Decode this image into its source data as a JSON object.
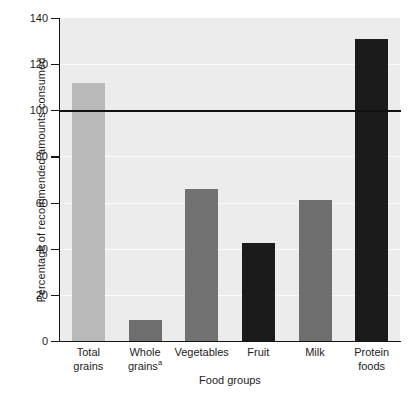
{
  "chart_data": {
    "type": "bar",
    "title": "",
    "subtitle": "",
    "xlabel": "Food groups",
    "ylabel": "Percentage of recommended amounts consumed",
    "categories": [
      "Total grains",
      "Whole grainsᵃ",
      "Vegetables",
      "Fruit",
      "Milk",
      "Protein foods"
    ],
    "category_lines": [
      [
        "Total",
        "grains"
      ],
      [
        "Whole",
        "grains"
      ],
      [
        "Vegetables"
      ],
      [
        "Fruit"
      ],
      [
        "Milk"
      ],
      [
        "Protein",
        "foods"
      ]
    ],
    "category_footnote_markers": [
      "",
      "a",
      "",
      "",
      "",
      ""
    ],
    "values": [
      112,
      9,
      66,
      42.5,
      61,
      131
    ],
    "bar_colors": [
      "#b9b9b9",
      "#6e6e6e",
      "#727272",
      "#1b1b1b",
      "#6e6e6e",
      "#1b1b1b"
    ],
    "ylim": [
      0,
      140
    ],
    "xlim_note": "categorical",
    "ytick_values": [
      0,
      20,
      40,
      60,
      80,
      100,
      120,
      140
    ],
    "ytick_labels": [
      "0",
      "20",
      "40",
      "60",
      "80",
      "100",
      "120",
      "140"
    ],
    "grid": true,
    "gridlines_at": [
      20,
      40,
      60,
      80,
      100,
      120
    ],
    "legend": null,
    "legend_position": "none",
    "reference_line": {
      "value": 100,
      "label": "",
      "color": "#111111"
    },
    "plot_background": "#ececec",
    "figure_background": "#ffffff",
    "annotations": []
  }
}
